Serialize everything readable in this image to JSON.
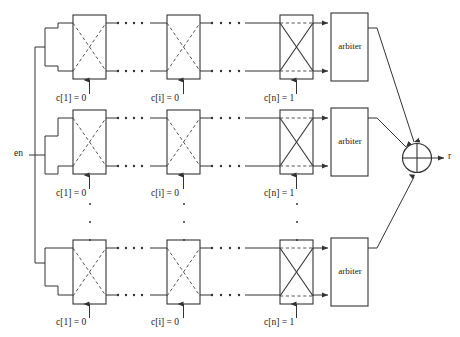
{
  "figure": {
    "type": "circuit-diagram",
    "name": "arbiter-puf-array",
    "width": 460,
    "height": 337,
    "background": "#ffffff",
    "line_color": "#333333",
    "text_color": "#1a1a1a"
  },
  "inputs": {
    "enable_label": "en"
  },
  "output": {
    "label": "r"
  },
  "xor": {
    "name": "xor-gate",
    "glyph": "circle-plus"
  },
  "arbiter": {
    "label": "arbiter"
  },
  "columns": [
    {
      "key": "first",
      "control_text": "c[1] = 0",
      "control_var": "c",
      "index": "1",
      "value": "0",
      "crossed": false
    },
    {
      "key": "middle",
      "control_text": "c[i] = 0",
      "control_var": "c",
      "index": "i",
      "value": "0",
      "crossed": false
    },
    {
      "key": "last",
      "control_text": "c[n] = 1",
      "control_var": "c",
      "index": "n",
      "value": "1",
      "crossed": true
    }
  ],
  "rows": [
    {
      "key": "row-1",
      "label": "stage-row-top"
    },
    {
      "key": "row-2",
      "label": "stage-row-middle"
    },
    {
      "key": "row-3",
      "label": "stage-row-bottom"
    }
  ],
  "ellipsis": {
    "horizontal_dots": 4,
    "vertical_dots": 3
  },
  "controls": {
    "r1c1": "c[1] = 0",
    "r1c2": "c[i] = 0",
    "r1c3": "c[n] = 1",
    "r2c1": "c[1] = 0",
    "r2c2": "c[i] = 0",
    "r2c3": "c[n] = 1",
    "r3c1": "c[1] = 0",
    "r3c2": "c[i] = 0",
    "r3c3": "c[n] = 1"
  },
  "arbiters": {
    "a1": "arbiter",
    "a2": "arbiter",
    "a3": "arbiter"
  }
}
